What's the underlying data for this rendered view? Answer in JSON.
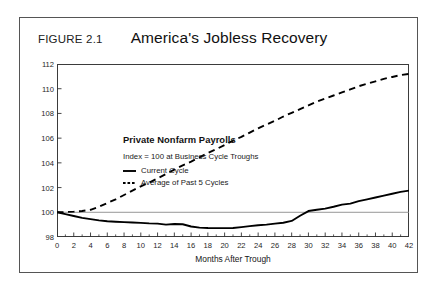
{
  "figure": {
    "number": "FIGURE 2.1",
    "title": "America's Jobless Recovery",
    "source_note": "Source: Bureau of Labor Statistics and Morgan Stanley Research"
  },
  "legend": {
    "title": "Private Nonfarm Payrolls",
    "subtitle": "Index = 100 at Business Cycle Troughs",
    "items": [
      {
        "label": "Current Cycle",
        "style": "solid",
        "color": "#000000"
      },
      {
        "label": "Average of Past 5 Cycles",
        "style": "dashed",
        "color": "#000000"
      }
    ]
  },
  "chart_data": {
    "type": "line",
    "title": "America's Jobless Recovery",
    "subtitle": "Private Nonfarm Payrolls",
    "annotation": "Index = 100 at Business Cycle Troughs",
    "xlabel": "Months After Trough",
    "ylabel": "",
    "xlim": [
      0,
      42
    ],
    "ylim": [
      98,
      112
    ],
    "xticks": [
      0,
      2,
      4,
      6,
      8,
      10,
      12,
      14,
      16,
      18,
      20,
      22,
      24,
      26,
      28,
      30,
      32,
      34,
      36,
      38,
      40,
      42
    ],
    "yticks": [
      98,
      100,
      102,
      104,
      106,
      108,
      110,
      112
    ],
    "grid": false,
    "reference_line": 100,
    "legend_position": "inside-top-left",
    "x": [
      0,
      1,
      2,
      3,
      4,
      5,
      6,
      7,
      8,
      9,
      10,
      11,
      12,
      13,
      14,
      15,
      16,
      17,
      18,
      19,
      20,
      21,
      22,
      23,
      24,
      25,
      26,
      27,
      28,
      29,
      30,
      31,
      32,
      33,
      34,
      35,
      36,
      37,
      38,
      39,
      40,
      41,
      42
    ],
    "series": [
      {
        "name": "Current Cycle",
        "style": "solid",
        "color": "#000000",
        "values": [
          100.0,
          99.85,
          99.7,
          99.55,
          99.45,
          99.35,
          99.27,
          99.24,
          99.2,
          99.17,
          99.14,
          99.1,
          99.08,
          99.0,
          99.05,
          99.03,
          98.85,
          98.76,
          98.73,
          98.72,
          98.72,
          98.73,
          98.8,
          98.88,
          98.95,
          99.0,
          99.08,
          99.15,
          99.3,
          99.72,
          100.1,
          100.2,
          100.3,
          100.45,
          100.62,
          100.7,
          100.9,
          101.05,
          101.2,
          101.35,
          101.5,
          101.65,
          101.75
        ]
      },
      {
        "name": "Average of Past 5 Cycles",
        "style": "dashed",
        "color": "#000000",
        "values": [
          100.0,
          100.02,
          100.05,
          100.1,
          100.2,
          100.45,
          100.75,
          101.05,
          101.4,
          101.75,
          102.1,
          102.4,
          102.75,
          103.1,
          103.45,
          103.8,
          104.1,
          104.45,
          104.8,
          105.1,
          105.45,
          105.8,
          106.1,
          106.45,
          106.8,
          107.1,
          107.4,
          107.75,
          108.05,
          108.35,
          108.65,
          108.95,
          109.2,
          109.45,
          109.7,
          109.95,
          110.2,
          110.4,
          110.6,
          110.8,
          110.95,
          111.1,
          111.2
        ]
      }
    ]
  }
}
